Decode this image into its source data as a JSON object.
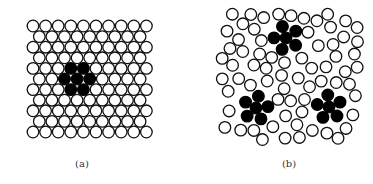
{
  "figure": {
    "panels": [
      {
        "id": "a",
        "label": "(a)",
        "description": "Ordered hexagonal packing of discs with a central hexagonal cluster of 7 black discs",
        "lattice": "hexagonal",
        "rows": 11,
        "discs_per_row_pattern": [
          10,
          9
        ],
        "black_cluster_count": 1,
        "black_cluster_shape": "hexagon (center + 6 neighbors)",
        "black_discs_per_cluster": 7
      },
      {
        "id": "b",
        "label": "(b)",
        "description": "Disordered packing of discs containing three pentagonal clusters of black discs",
        "lattice": "disordered",
        "black_cluster_count": 3,
        "black_cluster_shape": "pentagon (center + 5 petals)",
        "black_discs_per_cluster": 6
      }
    ],
    "colors": {
      "disc_fill": "#ffffff",
      "disc_stroke": "#111111",
      "cluster_fill": "#000000",
      "background": "#ffffff"
    }
  }
}
